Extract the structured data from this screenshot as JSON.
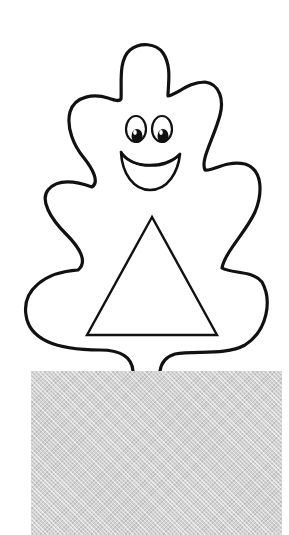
{
  "illustration": {
    "subject": "smiling blob character with a triangle on its body",
    "style": "black outline coloring page",
    "colors": {
      "background": "#ffffff",
      "outline": "#111111",
      "pupil": "#111111",
      "highlight": "#ffffff",
      "base_box": "#d2d2d2"
    },
    "character": {
      "name": "blob-character",
      "expression": "smiling",
      "eyes": [
        {
          "side": "left",
          "cx": 136,
          "cy": 130,
          "rx": 10,
          "ry": 13
        },
        {
          "side": "right",
          "cx": 162,
          "cy": 130,
          "rx": 10,
          "ry": 13
        }
      ],
      "mouth": "open smile",
      "body_shape": "triangle",
      "triangle": {
        "apex": [
          152,
          217
        ],
        "bottom_left": [
          87,
          335
        ],
        "bottom_right": [
          217,
          335
        ]
      }
    },
    "base": {
      "shape": "rectangle",
      "fill": "gray dotted halftone",
      "x": 31,
      "y": 371,
      "width": 251,
      "height": 164
    }
  }
}
